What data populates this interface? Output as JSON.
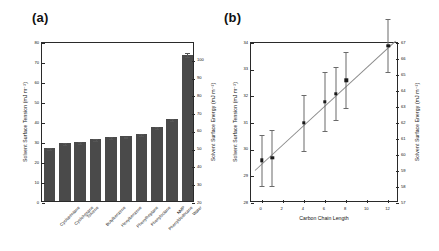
{
  "figure": {
    "panel_a_label": "(a)",
    "panel_b_label": "(b)"
  },
  "chart_data": [
    {
      "type": "bar",
      "panel": "(a)",
      "title": "",
      "xlabel": "",
      "ylabel": "Solvent Surface Tension (mJ m⁻²)",
      "y2label": "Solvent Surface Energy (mJ m⁻²)",
      "categories": [
        "Cyclopentane",
        "Cyclohexane",
        "Toluene",
        "Butylbenzene",
        "Hexylbenzene",
        "Phenylheptane",
        "Phenyloctane",
        "Phenyldodecane",
        "NMP",
        "Water"
      ],
      "values": [
        26.5,
        29.2,
        29.4,
        31.0,
        31.8,
        32.3,
        33.4,
        36.8,
        41.2,
        72.8
      ],
      "errors": [
        1.0,
        0.9,
        0.9,
        0.9,
        1.0,
        0.9,
        0.9,
        1.0,
        1.0,
        2.0
      ],
      "ylim": [
        0,
        80
      ],
      "yticks": [
        0,
        10,
        20,
        30,
        40,
        50,
        60,
        70,
        80
      ],
      "y2lim": [
        20,
        110
      ],
      "y2ticks": [
        20,
        30,
        40,
        50,
        60,
        70,
        80,
        90,
        100
      ],
      "grid": false,
      "legend": "none",
      "bar_color": "#4a4a4a"
    },
    {
      "type": "scatter",
      "panel": "(b)",
      "title": "",
      "xlabel": "Carbon Chain Length",
      "ylabel": "Solvent Surface Tension (mJ m⁻²)",
      "y2label": "Solvent Surface Energy (mJ m⁻²)",
      "x": [
        0,
        1,
        4,
        6,
        7,
        8,
        12
      ],
      "y": [
        29.6,
        29.7,
        31.0,
        31.8,
        32.1,
        32.6,
        33.9
      ],
      "yerr": [
        0.95,
        1.05,
        1.05,
        1.1,
        1.0,
        1.05,
        1.0
      ],
      "xlim": [
        -1,
        13
      ],
      "xticks": [
        0,
        2,
        4,
        6,
        8,
        10,
        12
      ],
      "ylim": [
        28,
        34
      ],
      "yticks": [
        28,
        29,
        30,
        31,
        32,
        33,
        34
      ],
      "y2lim": [
        57,
        67
      ],
      "y2ticks": [
        57,
        58,
        59,
        60,
        61,
        62,
        63,
        64,
        65,
        66,
        67
      ],
      "grid": false,
      "legend": "none",
      "marker_color": "#1a1a1a",
      "fit_line": {
        "x0": -0.6,
        "y0": 29.25,
        "x1": 12.7,
        "y1": 34.1
      }
    }
  ]
}
